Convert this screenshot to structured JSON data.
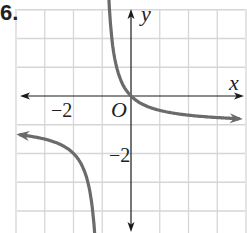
{
  "problem_number": "6.",
  "axes": {
    "x_label": "x",
    "y_label": "y",
    "origin_label": "O",
    "x_tick_label": "−2",
    "y_tick_label": "−2"
  },
  "colors": {
    "grid": "#d6d6d6",
    "axis": "#1a1a1a",
    "curve": "#6b6b6b",
    "text": "#222222"
  },
  "chart_data": {
    "type": "line",
    "title": "",
    "function": "y = -x/(x+1)",
    "xlabel": "x",
    "ylabel": "y",
    "xlim": [
      -4,
      4
    ],
    "ylim": [
      -4.7,
      3
    ],
    "grid": true,
    "grid_step": 1,
    "tick_labels": {
      "x": [
        {
          "value": -2,
          "label": "−2"
        }
      ],
      "y": [
        {
          "value": -2,
          "label": "−2"
        }
      ],
      "origin": "O"
    },
    "asymptotes": {
      "vertical": -1,
      "horizontal": -1
    },
    "series": [
      {
        "name": "right branch",
        "x": [
          -0.78,
          -0.7,
          -0.6,
          -0.5,
          -0.4,
          -0.2,
          0,
          0.5,
          1,
          2,
          3,
          4
        ],
        "y": [
          3.5,
          2.33,
          1.5,
          1.0,
          0.67,
          0.25,
          0,
          -0.33,
          -0.5,
          -0.67,
          -0.75,
          -0.8
        ],
        "arrows": "both ends"
      },
      {
        "name": "left branch",
        "x": [
          -3.9,
          -3,
          -2.5,
          -2,
          -1.7,
          -1.5,
          -1.4,
          -1.3,
          -1.24
        ],
        "y": [
          -1.34,
          -1.5,
          -1.67,
          -2,
          -2.43,
          -3,
          -3.5,
          -4.33,
          -4.7
        ],
        "arrows": "both ends"
      }
    ]
  }
}
